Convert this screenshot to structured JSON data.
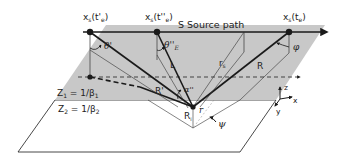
{
  "diagram": {
    "labels": {
      "source_path": "S Source path",
      "point_prime": "x",
      "point_prime_sub": "s",
      "point_prime_arg": "(t'",
      "point_prime_argsub": "e",
      "point_prime_close": ")",
      "point_dprime": "x",
      "point_dprime_sub": "s",
      "point_dprime_arg": "(t''",
      "point_dprime_argsub": "e",
      "point_dprime_close": ")",
      "point_e": "x",
      "point_e_sub": "s",
      "point_e_arg": "(t",
      "point_e_argsub": "e",
      "point_e_close": ")",
      "theta_prime": "θ'",
      "theta_E": "θ''",
      "theta_E_sub": "E",
      "phi": "φ",
      "L": "L",
      "r_s": "r",
      "r_s_sub": "s",
      "R_big": "R",
      "R_prime": "R'",
      "alpha": "α''",
      "R_vertex": "R",
      "R_vertex_sub": "i",
      "r": "r",
      "psi": "ψ",
      "Z1": "Z",
      "Z1_sub": "1",
      "Z1_rest": " = 1/β",
      "Z1_rest_sub": "1",
      "Z2": "Z",
      "Z2_sub": "2",
      "Z2_rest": " = 1/β",
      "Z2_rest_sub": "2",
      "axis_z": "z",
      "axis_x": "x",
      "axis_y": "y"
    },
    "colors": {
      "upper_layer_fill": "#c8c8c8",
      "lower_layer_fill": "#ffffff",
      "line": "#1a1a1a"
    }
  }
}
